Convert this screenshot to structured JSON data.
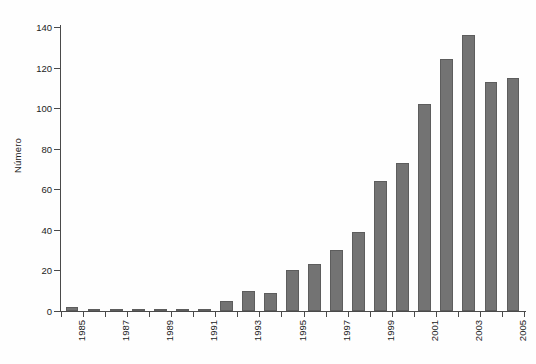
{
  "chart_data": {
    "type": "bar",
    "title": "",
    "subtitle": "",
    "xlabel": "",
    "ylabel": "Número",
    "ylim": [
      0,
      140
    ],
    "ytick_values": [
      0,
      20,
      40,
      60,
      80,
      100,
      120,
      140
    ],
    "ytick_labels": [
      "0",
      "20",
      "40",
      "60",
      "80",
      "100",
      "120",
      "140"
    ],
    "grid": false,
    "legend": null,
    "bar_color": "#737373",
    "bar_edge_color": "#5d5d5d",
    "axis_color": "#4a4a4a",
    "background_color": "#fefefe",
    "xtick_label_rotation": -90,
    "xtick_labels_shown_every": 2,
    "categories": [
      "1985",
      "1986",
      "1987",
      "1988",
      "1989",
      "1990",
      "1991",
      "1992",
      "1993",
      "1994",
      "1995",
      "1996",
      "1997",
      "1998",
      "1999",
      "2000",
      "2001",
      "2002",
      "2003",
      "2004",
      "2005"
    ],
    "visible_xtick_labels": [
      "1985",
      "1987",
      "1989",
      "1991",
      "1993",
      "1995",
      "1997",
      "1999",
      "2001",
      "2003",
      "2005"
    ],
    "values": [
      2,
      1,
      1,
      1,
      1,
      1,
      1,
      5,
      10,
      9,
      20,
      23,
      30,
      39,
      64,
      73,
      102,
      124,
      136,
      113,
      115
    ]
  }
}
